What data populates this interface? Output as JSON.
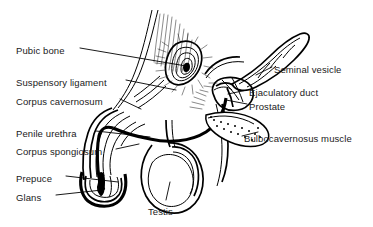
{
  "figure": {
    "background_color": "#ffffff",
    "ink_color": "#000000",
    "text_color": "#1a1a1a",
    "width": 373,
    "height": 227
  },
  "labels_left": [
    {
      "id": "pubic-bone",
      "text": "Pubic bone",
      "x": 16,
      "y": 45
    },
    {
      "id": "suspensory-ligament",
      "text": "Suspensory ligament",
      "x": 16,
      "y": 77
    },
    {
      "id": "corpus-cavernosum",
      "text": "Corpus cavernosum",
      "x": 16,
      "y": 96
    },
    {
      "id": "penile-urethra",
      "text": "Penile urethra",
      "x": 16,
      "y": 128
    },
    {
      "id": "corpus-spongiosum",
      "text": "Corpus spongiosum",
      "x": 16,
      "y": 146
    },
    {
      "id": "prepuce",
      "text": "Prepuce",
      "x": 16,
      "y": 173
    },
    {
      "id": "glans",
      "text": "Glans",
      "x": 16,
      "y": 192
    }
  ],
  "labels_right": [
    {
      "id": "seminal-vesicle",
      "text": "Seminal vesicle",
      "x": 274,
      "y": 64
    },
    {
      "id": "ejaculatory-duct",
      "text": "Ejaculatory duct",
      "x": 249,
      "y": 87
    },
    {
      "id": "prostate",
      "text": "Prostate",
      "x": 249,
      "y": 101
    },
    {
      "id": "bulbocavernosus-muscle",
      "text": "Bulbocavernosus muscle",
      "x": 244,
      "y": 133
    }
  ],
  "labels_bottom": [
    {
      "id": "testis",
      "text": "Testis",
      "x": 148,
      "y": 206
    }
  ]
}
